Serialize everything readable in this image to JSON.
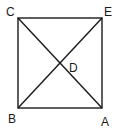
{
  "diagram": {
    "type": "square-with-diagonals",
    "vertices": [
      {
        "label": "C",
        "x": 18,
        "y": 18,
        "lx": 6,
        "ly": 16
      },
      {
        "label": "E",
        "x": 102,
        "y": 18,
        "lx": 104,
        "ly": 16
      },
      {
        "label": "A",
        "x": 102,
        "y": 108,
        "lx": 101,
        "ly": 126
      },
      {
        "label": "B",
        "x": 18,
        "y": 108,
        "lx": 8,
        "ly": 123
      }
    ],
    "intersection": {
      "label": "D",
      "x": 60,
      "y": 63,
      "lx": 69,
      "ly": 72
    },
    "edges": [
      [
        "C",
        "E"
      ],
      [
        "E",
        "A"
      ],
      [
        "A",
        "B"
      ],
      [
        "B",
        "C"
      ]
    ],
    "diagonals": [
      [
        "C",
        "A"
      ],
      [
        "B",
        "E"
      ]
    ],
    "stroke_color": "#1a1a1a",
    "labels": {
      "C": "C",
      "E": "E",
      "A": "A",
      "B": "B",
      "D": "D"
    }
  }
}
